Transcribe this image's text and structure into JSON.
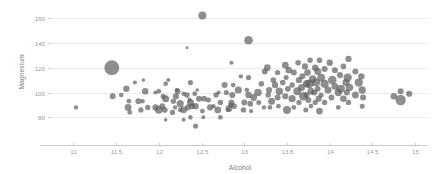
{
  "chart_data": {
    "type": "scatter",
    "title": "",
    "xlabel": "Alcohol",
    "ylabel": "Magnesium",
    "xlim": [
      10.75,
      15.15
    ],
    "ylim": [
      65,
      168
    ],
    "grid": true,
    "grid_axis": "y",
    "legend": "none",
    "marker_color": "#595959",
    "marker_opacity": 0.68,
    "size_encodes_third_variable": true,
    "size_range_px": [
      1.1,
      7.5
    ],
    "xticks": [
      "11",
      "11.5",
      "12",
      "12.5",
      "13",
      "13.5",
      "14",
      "14.5",
      "15"
    ],
    "xtick_values": [
      11,
      11.5,
      12,
      12.5,
      13,
      13.5,
      14,
      14.5,
      15
    ],
    "yticks": [
      "80",
      "100",
      "120",
      "140",
      "160"
    ],
    "ytick_values": [
      80,
      100,
      120,
      140,
      160
    ],
    "series": [
      {
        "name": "wine samples",
        "points": [
          {
            "x": 11.03,
            "y": 88,
            "s": 2.2
          },
          {
            "x": 11.45,
            "y": 120,
            "s": 7.4
          },
          {
            "x": 11.46,
            "y": 97,
            "s": 3.0
          },
          {
            "x": 11.56,
            "y": 98,
            "s": 2.3
          },
          {
            "x": 11.62,
            "y": 103,
            "s": 3.2
          },
          {
            "x": 11.64,
            "y": 88,
            "s": 3.4
          },
          {
            "x": 11.65,
            "y": 93,
            "s": 2.4
          },
          {
            "x": 11.66,
            "y": 84,
            "s": 2.4
          },
          {
            "x": 11.72,
            "y": 108,
            "s": 2.0
          },
          {
            "x": 11.76,
            "y": 93,
            "s": 2.9
          },
          {
            "x": 11.79,
            "y": 86,
            "s": 2.6
          },
          {
            "x": 11.81,
            "y": 93,
            "s": 2.2
          },
          {
            "x": 11.82,
            "y": 110,
            "s": 1.8
          },
          {
            "x": 11.84,
            "y": 101,
            "s": 3.3
          },
          {
            "x": 11.87,
            "y": 88,
            "s": 2.7
          },
          {
            "x": 11.96,
            "y": 88,
            "s": 3.1
          },
          {
            "x": 11.96,
            "y": 100,
            "s": 2.1
          },
          {
            "x": 12.0,
            "y": 86,
            "s": 3.8
          },
          {
            "x": 12.0,
            "y": 101,
            "s": 2.4
          },
          {
            "x": 12.04,
            "y": 89,
            "s": 3.0
          },
          {
            "x": 12.05,
            "y": 97,
            "s": 2.5
          },
          {
            "x": 12.07,
            "y": 86,
            "s": 2.8
          },
          {
            "x": 12.08,
            "y": 78,
            "s": 1.8
          },
          {
            "x": 12.08,
            "y": 107,
            "s": 2.3
          },
          {
            "x": 12.08,
            "y": 95,
            "s": 3.5
          },
          {
            "x": 12.11,
            "y": 110,
            "s": 2.0
          },
          {
            "x": 12.16,
            "y": 84,
            "s": 2.6
          },
          {
            "x": 12.17,
            "y": 93,
            "s": 2.7
          },
          {
            "x": 12.19,
            "y": 88,
            "s": 2.2
          },
          {
            "x": 12.2,
            "y": 97,
            "s": 3.1
          },
          {
            "x": 12.21,
            "y": 102,
            "s": 1.9
          },
          {
            "x": 12.22,
            "y": 101,
            "s": 2.9
          },
          {
            "x": 12.25,
            "y": 91,
            "s": 3.6
          },
          {
            "x": 12.25,
            "y": 86,
            "s": 2.3
          },
          {
            "x": 12.29,
            "y": 99,
            "s": 2.2
          },
          {
            "x": 12.29,
            "y": 86,
            "s": 3.3
          },
          {
            "x": 12.29,
            "y": 78,
            "s": 2.0
          },
          {
            "x": 12.33,
            "y": 136,
            "s": 1.4
          },
          {
            "x": 12.33,
            "y": 98,
            "s": 2.8
          },
          {
            "x": 12.34,
            "y": 88,
            "s": 3.0
          },
          {
            "x": 12.36,
            "y": 94,
            "s": 2.1
          },
          {
            "x": 12.37,
            "y": 92,
            "s": 3.5
          },
          {
            "x": 12.37,
            "y": 108,
            "s": 2.6
          },
          {
            "x": 12.37,
            "y": 80,
            "s": 2.3
          },
          {
            "x": 12.39,
            "y": 89,
            "s": 2.8
          },
          {
            "x": 12.42,
            "y": 99,
            "s": 2.4
          },
          {
            "x": 12.43,
            "y": 89,
            "s": 3.2
          },
          {
            "x": 12.43,
            "y": 73,
            "s": 2.6
          },
          {
            "x": 12.45,
            "y": 102,
            "s": 1.8
          },
          {
            "x": 12.47,
            "y": 95,
            "s": 3.0
          },
          {
            "x": 12.51,
            "y": 162,
            "s": 4.0
          },
          {
            "x": 12.51,
            "y": 85,
            "s": 2.4
          },
          {
            "x": 12.52,
            "y": 80,
            "s": 2.0
          },
          {
            "x": 12.53,
            "y": 95,
            "s": 2.9
          },
          {
            "x": 12.58,
            "y": 94,
            "s": 2.5
          },
          {
            "x": 12.6,
            "y": 88,
            "s": 3.1
          },
          {
            "x": 12.64,
            "y": 89,
            "s": 2.2
          },
          {
            "x": 12.67,
            "y": 98,
            "s": 2.7
          },
          {
            "x": 12.69,
            "y": 86,
            "s": 3.4
          },
          {
            "x": 12.7,
            "y": 100,
            "s": 2.0
          },
          {
            "x": 12.72,
            "y": 92,
            "s": 2.8
          },
          {
            "x": 12.72,
            "y": 80,
            "s": 2.3
          },
          {
            "x": 12.77,
            "y": 106,
            "s": 3.0
          },
          {
            "x": 12.79,
            "y": 100,
            "s": 2.6
          },
          {
            "x": 12.81,
            "y": 86,
            "s": 2.1
          },
          {
            "x": 12.82,
            "y": 87,
            "s": 3.3
          },
          {
            "x": 12.84,
            "y": 90,
            "s": 2.5
          },
          {
            "x": 12.85,
            "y": 92,
            "s": 2.9
          },
          {
            "x": 12.85,
            "y": 124,
            "s": 2.0
          },
          {
            "x": 12.86,
            "y": 98,
            "s": 3.1
          },
          {
            "x": 12.87,
            "y": 106,
            "s": 2.4
          },
          {
            "x": 12.88,
            "y": 89,
            "s": 2.8
          },
          {
            "x": 12.93,
            "y": 102,
            "s": 3.6
          },
          {
            "x": 12.96,
            "y": 113,
            "s": 2.2
          },
          {
            "x": 12.99,
            "y": 86,
            "s": 2.7
          },
          {
            "x": 13.0,
            "y": 92,
            "s": 3.0
          },
          {
            "x": 13.03,
            "y": 102,
            "s": 2.3
          },
          {
            "x": 13.05,
            "y": 142,
            "s": 4.3
          },
          {
            "x": 13.05,
            "y": 98,
            "s": 3.2
          },
          {
            "x": 13.05,
            "y": 112,
            "s": 2.6
          },
          {
            "x": 13.07,
            "y": 91,
            "s": 2.9
          },
          {
            "x": 13.08,
            "y": 85,
            "s": 2.1
          },
          {
            "x": 13.11,
            "y": 96,
            "s": 3.4
          },
          {
            "x": 13.16,
            "y": 100,
            "s": 3.8
          },
          {
            "x": 13.17,
            "y": 92,
            "s": 2.5
          },
          {
            "x": 13.2,
            "y": 107,
            "s": 2.8
          },
          {
            "x": 13.23,
            "y": 88,
            "s": 2.2
          },
          {
            "x": 13.24,
            "y": 117,
            "s": 3.0
          },
          {
            "x": 13.27,
            "y": 120,
            "s": 3.3
          },
          {
            "x": 13.28,
            "y": 98,
            "s": 2.7
          },
          {
            "x": 13.29,
            "y": 102,
            "s": 3.1
          },
          {
            "x": 13.3,
            "y": 88,
            "s": 2.4
          },
          {
            "x": 13.32,
            "y": 93,
            "s": 3.5
          },
          {
            "x": 13.34,
            "y": 110,
            "s": 2.9
          },
          {
            "x": 13.36,
            "y": 106,
            "s": 3.2
          },
          {
            "x": 13.39,
            "y": 116,
            "s": 2.6
          },
          {
            "x": 13.39,
            "y": 96,
            "s": 3.0
          },
          {
            "x": 13.4,
            "y": 89,
            "s": 2.3
          },
          {
            "x": 13.41,
            "y": 101,
            "s": 3.7
          },
          {
            "x": 13.45,
            "y": 108,
            "s": 2.8
          },
          {
            "x": 13.48,
            "y": 122,
            "s": 3.4
          },
          {
            "x": 13.48,
            "y": 97,
            "s": 3.1
          },
          {
            "x": 13.49,
            "y": 112,
            "s": 2.5
          },
          {
            "x": 13.5,
            "y": 86,
            "s": 4.0
          },
          {
            "x": 13.51,
            "y": 103,
            "s": 2.9
          },
          {
            "x": 13.52,
            "y": 118,
            "s": 3.3
          },
          {
            "x": 13.56,
            "y": 95,
            "s": 3.6
          },
          {
            "x": 13.56,
            "y": 106,
            "s": 2.7
          },
          {
            "x": 13.58,
            "y": 116,
            "s": 3.0
          },
          {
            "x": 13.58,
            "y": 88,
            "s": 2.4
          },
          {
            "x": 13.62,
            "y": 101,
            "s": 3.9
          },
          {
            "x": 13.63,
            "y": 124,
            "s": 2.8
          },
          {
            "x": 13.64,
            "y": 110,
            "s": 3.2
          },
          {
            "x": 13.64,
            "y": 92,
            "s": 2.6
          },
          {
            "x": 13.67,
            "y": 104,
            "s": 3.5
          },
          {
            "x": 13.68,
            "y": 113,
            "s": 3.0
          },
          {
            "x": 13.69,
            "y": 97,
            "s": 4.2
          },
          {
            "x": 13.71,
            "y": 121,
            "s": 3.1
          },
          {
            "x": 13.72,
            "y": 86,
            "s": 2.5
          },
          {
            "x": 13.73,
            "y": 107,
            "s": 3.8
          },
          {
            "x": 13.73,
            "y": 98,
            "s": 2.9
          },
          {
            "x": 13.74,
            "y": 116,
            "s": 3.3
          },
          {
            "x": 13.75,
            "y": 94,
            "s": 3.0
          },
          {
            "x": 13.76,
            "y": 107,
            "s": 4.4
          },
          {
            "x": 13.77,
            "y": 126,
            "s": 2.7
          },
          {
            "x": 13.78,
            "y": 101,
            "s": 3.4
          },
          {
            "x": 13.78,
            "y": 89,
            "s": 2.3
          },
          {
            "x": 13.8,
            "y": 111,
            "s": 3.7
          },
          {
            "x": 13.82,
            "y": 100,
            "s": 3.0
          },
          {
            "x": 13.83,
            "y": 120,
            "s": 3.2
          },
          {
            "x": 13.83,
            "y": 92,
            "s": 2.6
          },
          {
            "x": 13.84,
            "y": 108,
            "s": 4.0
          },
          {
            "x": 13.86,
            "y": 103,
            "s": 2.9
          },
          {
            "x": 13.86,
            "y": 117,
            "s": 3.5
          },
          {
            "x": 13.87,
            "y": 95,
            "s": 3.1
          },
          {
            "x": 13.88,
            "y": 126,
            "s": 2.8
          },
          {
            "x": 13.88,
            "y": 85,
            "s": 3.3
          },
          {
            "x": 13.9,
            "y": 112,
            "s": 3.9
          },
          {
            "x": 13.9,
            "y": 98,
            "s": 2.5
          },
          {
            "x": 13.94,
            "y": 107,
            "s": 4.1
          },
          {
            "x": 13.94,
            "y": 119,
            "s": 3.0
          },
          {
            "x": 13.94,
            "y": 92,
            "s": 2.7
          },
          {
            "x": 13.98,
            "y": 102,
            "s": 3.6
          },
          {
            "x": 14.0,
            "y": 124,
            "s": 3.2
          },
          {
            "x": 14.02,
            "y": 96,
            "s": 2.9
          },
          {
            "x": 14.03,
            "y": 110,
            "s": 4.3
          },
          {
            "x": 14.06,
            "y": 105,
            "s": 3.4
          },
          {
            "x": 14.06,
            "y": 118,
            "s": 3.0
          },
          {
            "x": 14.1,
            "y": 100,
            "s": 3.7
          },
          {
            "x": 14.1,
            "y": 88,
            "s": 2.4
          },
          {
            "x": 14.12,
            "y": 114,
            "s": 3.1
          },
          {
            "x": 14.13,
            "y": 103,
            "s": 4.0
          },
          {
            "x": 14.16,
            "y": 121,
            "s": 2.8
          },
          {
            "x": 14.16,
            "y": 95,
            "s": 3.3
          },
          {
            "x": 14.19,
            "y": 108,
            "s": 3.6
          },
          {
            "x": 14.2,
            "y": 100,
            "s": 3.0
          },
          {
            "x": 14.21,
            "y": 112,
            "s": 4.2
          },
          {
            "x": 14.22,
            "y": 92,
            "s": 2.6
          },
          {
            "x": 14.22,
            "y": 127,
            "s": 3.1
          },
          {
            "x": 14.23,
            "y": 104,
            "s": 3.8
          },
          {
            "x": 14.3,
            "y": 117,
            "s": 3.0
          },
          {
            "x": 14.3,
            "y": 98,
            "s": 3.4
          },
          {
            "x": 14.34,
            "y": 108,
            "s": 4.1
          },
          {
            "x": 14.37,
            "y": 113,
            "s": 3.2
          },
          {
            "x": 14.38,
            "y": 102,
            "s": 3.7
          },
          {
            "x": 14.38,
            "y": 89,
            "s": 2.5
          },
          {
            "x": 14.39,
            "y": 96,
            "s": 3.0
          },
          {
            "x": 14.75,
            "y": 97,
            "s": 3.3
          },
          {
            "x": 14.83,
            "y": 94,
            "s": 5.2
          },
          {
            "x": 14.83,
            "y": 101,
            "s": 3.0
          },
          {
            "x": 14.93,
            "y": 99,
            "s": 3.1
          }
        ]
      }
    ]
  },
  "axes": {
    "x_title": "Alcohol",
    "y_title": "Magnesium"
  }
}
